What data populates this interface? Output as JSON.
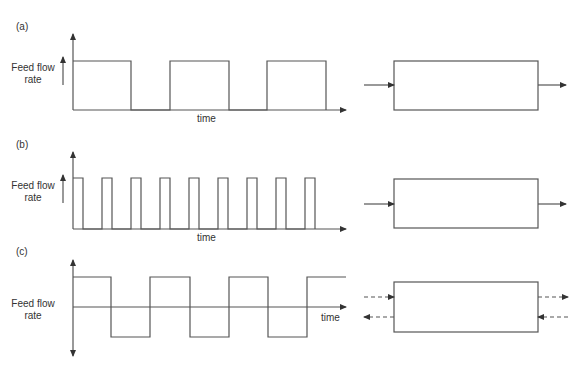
{
  "panels": [
    {
      "id": "a",
      "label": "(a)",
      "ylabel_line1": "Feed flow",
      "ylabel_line2": "rate",
      "xlabel": "time",
      "waveform": "square pulses (3 wide pulses)",
      "reactor_flow": "unidirectional"
    },
    {
      "id": "b",
      "label": "(b)",
      "ylabel_line1": "Feed flow",
      "ylabel_line2": "rate",
      "xlabel": "time",
      "waveform": "square pulses (9 narrow pulses)",
      "reactor_flow": "unidirectional"
    },
    {
      "id": "c",
      "label": "(c)",
      "ylabel_line1": "Feed flow",
      "ylabel_line2": "rate",
      "xlabel": "time",
      "waveform": "symmetric square wave (oscillating flow)",
      "reactor_flow": "bidirectional (dashed)"
    }
  ],
  "colors": {
    "line": "#555555",
    "text": "#333333",
    "background": "#ffffff"
  }
}
